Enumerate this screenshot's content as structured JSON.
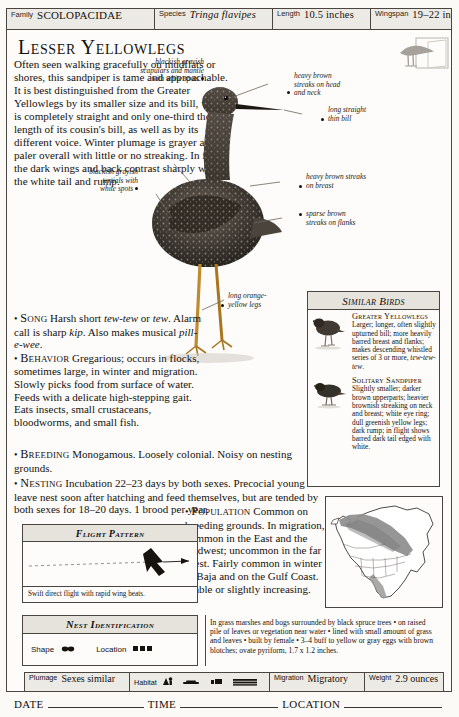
{
  "header": {
    "fields": [
      {
        "label": "Family",
        "value": "SCOLOPACIDAE",
        "style": "smallcaps"
      },
      {
        "label": "Species",
        "value": "Tringa flavipes",
        "style": "italic"
      },
      {
        "label": "Length",
        "value": "10.5 inches",
        "style": "plain"
      },
      {
        "label": "Wingspan",
        "value": "19–22 inches",
        "style": "plain"
      }
    ]
  },
  "title": "Lesser Yellowlegs",
  "badge_icon": "bird-silhouette-icon",
  "description": "Often seen walking gracefully on mudflats or shores, this sandpiper is tame and approachable. It is best distinguished from the Greater Yellowlegs by its smaller size and its bill, which is completely straight and only one-third the length of its cousin's bill, as well as by its different voice. Winter plumage is grayer and paler overall with little or no streaking. In flight the dark wings and back contrast sharply with the white tail and rump.",
  "annotations": [
    {
      "id": "head-neck",
      "text": "heavy brown\nstreaks on head\nand neck"
    },
    {
      "id": "bill",
      "text": "long straight\nthin bill"
    },
    {
      "id": "breast",
      "text": "heavy brown streaks\non breast"
    },
    {
      "id": "flanks",
      "text": "sparse brown\nstreaks on flanks"
    },
    {
      "id": "scapulars",
      "text": "blackish grayish\nscapulars and mantle\nwith white spots"
    },
    {
      "id": "tertials",
      "text": "blackish grayish\ntertials with\nwhite spots"
    },
    {
      "id": "legs",
      "text": "long orange-\nyellow legs"
    }
  ],
  "sections": [
    {
      "heading": "Song",
      "body": "Harsh short <em>tew-tew</em> or <em>tew</em>. Alarm call is sharp <em>kip</em>. Also makes musical <em>pill-e-wee</em>."
    },
    {
      "heading": "Behavior",
      "body": "Gregarious; occurs in flocks, sometimes large, in winter and migration. Slowly picks food from surface of water. Feeds with a delicate high-stepping gait. Eats insects, small crustaceans, bloodworms, and small fish."
    },
    {
      "heading": "Breeding",
      "body": "Monogamous. Loosely colonial. Noisy on nesting grounds."
    },
    {
      "heading": "Nesting",
      "body": "Incubation 22–23 days by both sexes. Precocial young leave nest soon after hatching and feed themselves, but are tended by both sexes for 18–20 days. 1 brood per year."
    },
    {
      "heading": "Population",
      "body": "Common on breeding grounds. In migration, common in the East and the Midwest; uncommon in the far West. Fairly common in winter in Baja and on the Gulf Coast. Stable or slightly increasing."
    }
  ],
  "similar_birds": {
    "title": "Similar Birds",
    "entries": [
      {
        "name": "Greater Yellowlegs",
        "desc": "Larger; longer, often slightly upturned bill; more heavily barred breast and flanks; makes descending whistled series of 3 or more, <em>tew-tew-tew</em>."
      },
      {
        "name": "Solitary Sandpiper",
        "desc": "Slightly smaller; darker brown upperparts; heavier brownish streaking on neck and breast; white eye ring; dull greenish yellow legs; dark rump; in flight shows barred dark tail edged with white."
      }
    ]
  },
  "flight_pattern": {
    "title": "Flight Pattern",
    "caption": "Swift direct flight with rapid wing beats."
  },
  "nest_identification": {
    "title": "Nest Identification",
    "shape_label": "Shape",
    "location_label": "Location",
    "description": "In grass marshes and bogs surrounded by black spruce trees • on raised pile of leaves or vegetation near water • lined with small amount of grass and leaves • built by female • 3–4 buff to yellow or gray eggs with brown blotches; ovate pyriform, 1.7 x 1.2 inches."
  },
  "status_bar": [
    {
      "label": "Plumage",
      "value": "Sexes similar",
      "type": "text"
    },
    {
      "label": "Habitat",
      "value": "",
      "type": "icons"
    },
    {
      "label": "Migration",
      "value": "Migratory",
      "type": "text"
    },
    {
      "label": "Weight",
      "value": "2.9 ounces",
      "type": "text"
    }
  ],
  "footer": {
    "date_label": "DATE",
    "time_label": "TIME",
    "location_label": "LOCATION"
  },
  "colors": {
    "ink": "#15110d",
    "rule": "#4a4540",
    "panel_header": "#e6e3dd",
    "map_range": "#8d8d8d"
  }
}
